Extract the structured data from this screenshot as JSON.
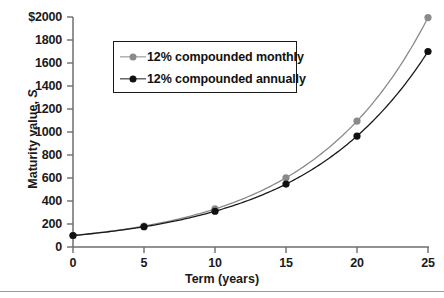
{
  "chart_data": {
    "type": "line",
    "title": "",
    "xlabel": "Term (years)",
    "ylabel": "Maturity value, S",
    "xlim": [
      0,
      25
    ],
    "ylim": [
      0,
      2000
    ],
    "grid": false,
    "legend_position": "upper-left-inside",
    "x": [
      0,
      5,
      10,
      15,
      20,
      25
    ],
    "xticklabels": [
      "0",
      "5",
      "10",
      "15",
      "20",
      "25"
    ],
    "yticks": [
      0,
      200,
      400,
      600,
      800,
      1000,
      1200,
      1400,
      1600,
      1800,
      2000
    ],
    "yticklabels": [
      "0",
      "200",
      "400",
      "600",
      "800",
      "1000",
      "1200",
      "1400",
      "1600",
      "1800",
      "$2000"
    ],
    "series": [
      {
        "name": "12% compounded monthly",
        "color": "#8a8a8a",
        "marker_color": "#8a8a8a",
        "values": [
          100,
          182,
          331,
          602,
          1095,
          1995
        ]
      },
      {
        "name": "12% compounded annually",
        "color": "#1a1a1a",
        "marker_color": "#111111",
        "values": [
          100,
          176,
          311,
          547,
          965,
          1700
        ]
      }
    ]
  },
  "axes": {
    "y_label_text": "Maturity value, ",
    "y_label_italic": "S",
    "x_label_text": "Term (years)"
  },
  "legend": {
    "entries": [
      {
        "label": "12% compounded monthly",
        "swatch": "gray-line-dot-marker"
      },
      {
        "label": "12% compounded annually",
        "swatch": "black-line-dot-marker"
      }
    ]
  },
  "colors": {
    "axis": "#6e6e6e",
    "text": "#1a1a1a",
    "monthly": "#8a8a8a",
    "annually": "#1a1a1a",
    "rule": "#9a9a9a",
    "background": "#ffffff"
  },
  "ticklabels": {
    "y": [
      "$2000",
      "1800",
      "1600",
      "1400",
      "1200",
      "1000",
      "800",
      "600",
      "400",
      "200",
      "0"
    ],
    "x": [
      "0",
      "5",
      "10",
      "15",
      "20",
      "25"
    ]
  }
}
